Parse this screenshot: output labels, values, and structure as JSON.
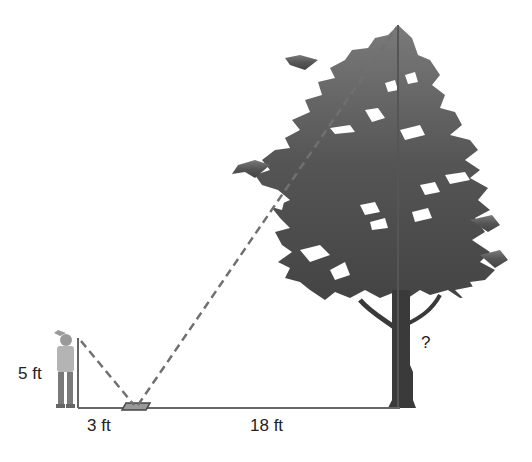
{
  "diagram": {
    "type": "similar-triangles-mirror-problem",
    "labels": {
      "person_height": "5 ft",
      "person_to_mirror": "3 ft",
      "mirror_to_tree": "18 ft",
      "tree_height": "?"
    },
    "colors": {
      "line": "#666666",
      "dash": "#6f6f6f",
      "tree": "#555555",
      "trunk": "#3a3a3a",
      "person": "#8a8a8a"
    }
  }
}
